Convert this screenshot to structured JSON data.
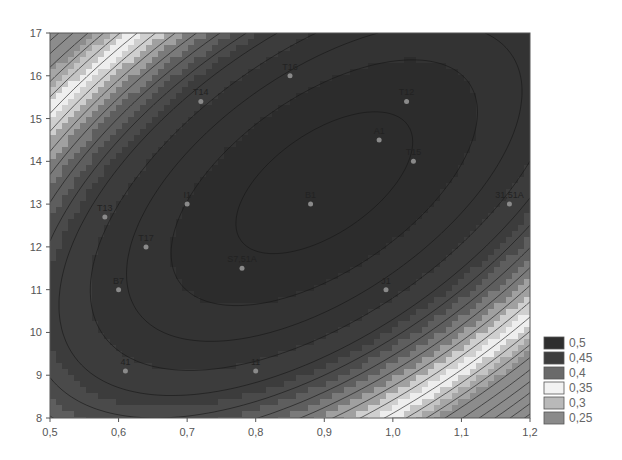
{
  "chart_data": {
    "type": "contour",
    "title": "",
    "xlabel": "",
    "ylabel": "",
    "xlim": [
      0.5,
      1.2
    ],
    "ylim": [
      8,
      17
    ],
    "x_ticks": [
      "0,5",
      "0,6",
      "0,7",
      "0,8",
      "0,9",
      "1,0",
      "1,1",
      "1,2"
    ],
    "x_tick_values": [
      0.5,
      0.6,
      0.7,
      0.8,
      0.9,
      1.0,
      1.1,
      1.2
    ],
    "y_ticks": [
      "8",
      "9",
      "10",
      "11",
      "12",
      "13",
      "14",
      "15",
      "16",
      "17"
    ],
    "y_tick_values": [
      8,
      9,
      10,
      11,
      12,
      13,
      14,
      15,
      16,
      17
    ],
    "grid": false,
    "legend_position": "right-bottom",
    "legend": [
      {
        "label": "0,5",
        "color": "#2e2e2e"
      },
      {
        "label": "0,45",
        "color": "#3d3d3d"
      },
      {
        "label": "0,4",
        "color": "#6a6a6a"
      },
      {
        "label": "0,35",
        "color": "#f2f2f2"
      },
      {
        "label": "0,3",
        "color": "#b9b9b9"
      },
      {
        "label": "0,25",
        "color": "#8a8a8a"
      }
    ],
    "surface": {
      "center_x": 0.9,
      "center_y": 13.5,
      "peak_value": 0.5,
      "description": "elliptical maximum tilted upward-right; lighter bands in upper-left and lower-right corners"
    },
    "points": [
      {
        "label": "T16",
        "x": 0.85,
        "y": 16.0
      },
      {
        "label": "T14",
        "x": 0.72,
        "y": 15.4
      },
      {
        "label": "T12",
        "x": 1.02,
        "y": 15.4
      },
      {
        "label": "A1",
        "x": 0.98,
        "y": 14.5
      },
      {
        "label": "T15",
        "x": 1.03,
        "y": 14.0
      },
      {
        "label": "B1",
        "x": 0.88,
        "y": 13.0
      },
      {
        "label": "I1",
        "x": 0.7,
        "y": 13.0
      },
      {
        "label": "31,51A",
        "x": 1.17,
        "y": 13.0
      },
      {
        "label": "T13",
        "x": 0.58,
        "y": 12.7
      },
      {
        "label": "T17",
        "x": 0.64,
        "y": 12.0
      },
      {
        "label": "S7,51A",
        "x": 0.78,
        "y": 11.5
      },
      {
        "label": "B7",
        "x": 0.6,
        "y": 11.0
      },
      {
        "label": "J1",
        "x": 0.99,
        "y": 11.0
      },
      {
        "label": "41",
        "x": 0.61,
        "y": 9.1
      },
      {
        "label": "11",
        "x": 0.8,
        "y": 9.1
      }
    ]
  }
}
